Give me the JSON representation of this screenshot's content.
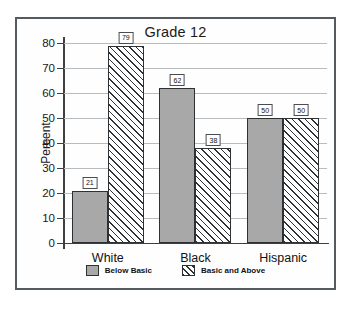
{
  "chart_data": {
    "type": "bar",
    "title": "Grade 12",
    "xlabel": "",
    "ylabel": "Percent",
    "categories": [
      "White",
      "Black",
      "Hispanic"
    ],
    "series": [
      {
        "name": "Below Basic",
        "values": [
          21,
          62,
          50
        ],
        "style": "solid-gray",
        "color": "#a8a8a8"
      },
      {
        "name": "Basic and Above",
        "values": [
          79,
          38,
          50
        ],
        "style": "diagonal-hatch",
        "color": "#ffffff"
      }
    ],
    "ylim": [
      0,
      80
    ],
    "yticks": [
      0,
      10,
      20,
      30,
      40,
      50,
      60,
      70,
      80
    ],
    "ytick_labels": [
      "0",
      "10",
      "20",
      "30",
      "40",
      "50",
      "60",
      "70",
      "80"
    ],
    "grid": true,
    "grid_axis": "y",
    "legend_position": "bottom",
    "data_labels": true,
    "frame": true
  }
}
